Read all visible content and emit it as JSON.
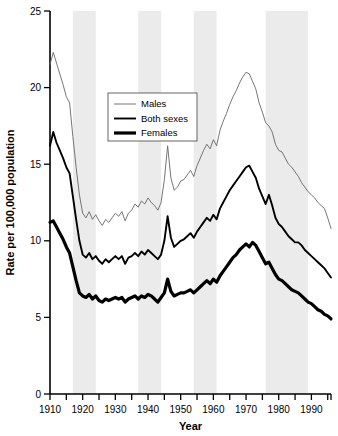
{
  "chart_data": {
    "type": "line",
    "title": "",
    "xlabel": "Year",
    "ylabel": "Rate per 100,000 population",
    "xlim": [
      1910,
      1996
    ],
    "ylim": [
      0,
      25
    ],
    "yticks": [
      0,
      5,
      10,
      15,
      20,
      25
    ],
    "xticks": [
      1910,
      1920,
      1930,
      1940,
      1950,
      1960,
      1970,
      1980,
      1990
    ],
    "xtick_labels": [
      "1910",
      "1920",
      "1930",
      "1940",
      "1950",
      "1960",
      "1970",
      "1980",
      "1990"
    ],
    "ytick_labels": [
      "0",
      "5",
      "10",
      "15",
      "20",
      "25"
    ],
    "xminor_step": 5,
    "grid": false,
    "legend_position": "upper-center-left",
    "shaded_bands": [
      {
        "start": 1917,
        "end": 1924
      },
      {
        "start": 1937,
        "end": 1944
      },
      {
        "start": 1954,
        "end": 1961
      },
      {
        "start": 1976,
        "end": 1989
      }
    ],
    "x": [
      1910,
      1911,
      1912,
      1913,
      1914,
      1915,
      1916,
      1917,
      1918,
      1919,
      1920,
      1921,
      1922,
      1923,
      1924,
      1925,
      1926,
      1927,
      1928,
      1929,
      1930,
      1931,
      1932,
      1933,
      1934,
      1935,
      1936,
      1937,
      1938,
      1939,
      1940,
      1941,
      1942,
      1943,
      1944,
      1945,
      1946,
      1947,
      1948,
      1949,
      1950,
      1951,
      1952,
      1953,
      1954,
      1955,
      1956,
      1957,
      1958,
      1959,
      1960,
      1961,
      1962,
      1963,
      1964,
      1965,
      1966,
      1967,
      1968,
      1969,
      1970,
      1971,
      1972,
      1973,
      1974,
      1975,
      1976,
      1977,
      1978,
      1979,
      1980,
      1981,
      1982,
      1983,
      1984,
      1985,
      1986,
      1987,
      1988,
      1989,
      1990,
      1991,
      1992,
      1993,
      1994,
      1995,
      1996
    ],
    "series": [
      {
        "name": "Males",
        "line_weight": "thin",
        "color": "#666666",
        "values": [
          21.5,
          22.3,
          21.6,
          20.9,
          20.2,
          19.4,
          19.0,
          16.8,
          14.8,
          13.0,
          11.8,
          11.5,
          11.9,
          11.4,
          11.7,
          11.3,
          11.0,
          11.4,
          11.2,
          11.5,
          11.8,
          11.6,
          11.9,
          11.3,
          11.8,
          12.0,
          12.4,
          12.2,
          12.6,
          12.4,
          12.8,
          12.5,
          12.3,
          12.0,
          12.5,
          14.0,
          16.2,
          14.1,
          13.3,
          13.5,
          13.9,
          14.0,
          14.3,
          14.6,
          14.2,
          14.9,
          15.4,
          15.9,
          16.3,
          16.0,
          16.6,
          16.2,
          17.2,
          17.8,
          18.3,
          18.9,
          19.4,
          19.8,
          20.3,
          20.7,
          21.0,
          20.9,
          20.4,
          19.9,
          19.0,
          18.4,
          17.7,
          17.5,
          17.1,
          16.3,
          15.9,
          15.8,
          15.4,
          15.0,
          14.8,
          14.5,
          14.2,
          13.8,
          13.5,
          13.2,
          13.0,
          12.8,
          12.5,
          12.3,
          12.1,
          11.5,
          10.8
        ]
      },
      {
        "name": "Both sexes",
        "line_weight": "medium",
        "color": "#000000",
        "values": [
          16.2,
          17.1,
          16.4,
          15.9,
          15.4,
          14.8,
          14.4,
          12.9,
          11.4,
          10.0,
          9.1,
          8.9,
          9.2,
          8.8,
          9.0,
          8.7,
          8.5,
          8.8,
          8.6,
          8.8,
          9.0,
          8.8,
          9.0,
          8.5,
          8.9,
          9.0,
          9.2,
          9.0,
          9.3,
          9.1,
          9.4,
          9.2,
          9.0,
          8.8,
          9.1,
          10.0,
          11.6,
          10.2,
          9.6,
          9.8,
          10.0,
          10.1,
          10.3,
          10.5,
          10.2,
          10.6,
          10.9,
          11.2,
          11.5,
          11.3,
          11.7,
          11.4,
          12.1,
          12.5,
          12.9,
          13.3,
          13.6,
          13.9,
          14.2,
          14.5,
          14.8,
          14.9,
          14.5,
          14.1,
          13.4,
          12.9,
          12.4,
          13.0,
          12.3,
          11.5,
          11.1,
          10.9,
          10.6,
          10.3,
          10.1,
          9.9,
          9.9,
          9.7,
          9.4,
          9.2,
          9.0,
          8.8,
          8.6,
          8.4,
          8.2,
          7.9,
          7.6
        ]
      },
      {
        "name": "Females",
        "line_weight": "thick",
        "color": "#000000",
        "values": [
          11.2,
          11.3,
          10.9,
          10.5,
          10.1,
          9.6,
          9.2,
          8.3,
          7.4,
          6.6,
          6.4,
          6.3,
          6.5,
          6.2,
          6.4,
          6.1,
          6.0,
          6.2,
          6.1,
          6.2,
          6.3,
          6.2,
          6.3,
          6.0,
          6.2,
          6.3,
          6.4,
          6.2,
          6.4,
          6.3,
          6.5,
          6.4,
          6.2,
          6.0,
          6.3,
          6.6,
          7.5,
          6.7,
          6.4,
          6.5,
          6.6,
          6.6,
          6.7,
          6.8,
          6.6,
          6.8,
          7.0,
          7.2,
          7.4,
          7.2,
          7.5,
          7.3,
          7.7,
          8.0,
          8.3,
          8.6,
          8.9,
          9.1,
          9.4,
          9.6,
          9.8,
          9.6,
          9.9,
          9.7,
          9.3,
          8.9,
          8.5,
          8.6,
          8.2,
          7.8,
          7.5,
          7.4,
          7.2,
          7.0,
          6.8,
          6.7,
          6.6,
          6.4,
          6.2,
          6.0,
          5.9,
          5.7,
          5.5,
          5.4,
          5.2,
          5.1,
          4.9
        ]
      }
    ]
  }
}
